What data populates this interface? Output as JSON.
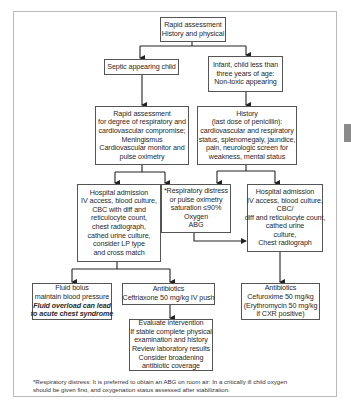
{
  "diagram": {
    "nodes": {
      "rapid_assessment": {
        "lines": [
          "Rapid assessment",
          "History and physical"
        ]
      },
      "septic": {
        "lines": [
          "Septic appearing child"
        ]
      },
      "infant": {
        "lines": [
          "Infant, child less than",
          "three years of age:",
          "Non-toxic appearing"
        ]
      },
      "rapid_assessment_degree": {
        "lines": [
          "Rapid assessment",
          "for degree of respiratory and",
          "cardiovascular compromise;",
          "Meningismus",
          "Cardiovascular monitor and",
          "pulse oximetry"
        ]
      },
      "history": {
        "lines": [
          "History",
          "(last dose of penicillin):",
          "cardiovascular and respiratory",
          "status, splenomegaly, jaundice,",
          "pain, neurologic screen for",
          "weakness, mental status"
        ]
      },
      "hospital_left": {
        "lines": [
          "Hospital admission",
          "IV access, blood culture,",
          "CBC with diff and",
          "reticulocyte count,",
          "chest radiograph,",
          "cathed urine culture,",
          "consider LP type",
          "and cross match"
        ]
      },
      "resp_distress": {
        "lines": [
          "*Respiratory distress",
          "or pulse oximetry",
          "saturation ≤90%",
          "Oxygen",
          "ABG"
        ]
      },
      "hospital_right": {
        "lines": [
          "Hospital admission",
          "IV access, blood culture,",
          "CBC/",
          "diff and reticulocyte count,",
          "cathed urine",
          "culture,",
          "Chest radiograph"
        ]
      },
      "fluid_bolus": {
        "lines": [
          "Fluid bolus",
          "maintain blood pressure"
        ],
        "emphasis": [
          "Fluid overload can lead",
          "to acute chest syndrome"
        ]
      },
      "antibiotics_ceftriaxone": {
        "lines": [
          "Antibiotics",
          "Ceftriaxone 50 mg/kg IV push"
        ]
      },
      "evaluate": {
        "lines": [
          "Evaluate intervention",
          "If stable complete physical",
          "examination and history",
          "Review laboratory results",
          "Consider broadening",
          "antibiotic coverage"
        ]
      },
      "antibiotics_cefuroxime": {
        "lines": [
          "Antibiotics",
          "Cefuroxime 50 mg/kg",
          "(Erythromycin 50 mg/kg",
          "if CXR positive)"
        ]
      }
    },
    "edges": [
      [
        "rapid_assessment",
        "septic"
      ],
      [
        "rapid_assessment",
        "infant"
      ],
      [
        "septic",
        "rapid_assessment_degree"
      ],
      [
        "infant",
        "history"
      ],
      [
        "rapid_assessment_degree",
        "hospital_left"
      ],
      [
        "rapid_assessment_degree",
        "resp_distress"
      ],
      [
        "history",
        "resp_distress"
      ],
      [
        "history",
        "hospital_right"
      ],
      [
        "resp_distress",
        "hospital_right"
      ],
      [
        "hospital_left",
        "fluid_bolus"
      ],
      [
        "hospital_left",
        "antibiotics_ceftriaxone"
      ],
      [
        "antibiotics_ceftriaxone",
        "evaluate"
      ],
      [
        "hospital_right",
        "antibiotics_cefuroxime"
      ]
    ],
    "footnote": [
      "*Respiratory distress: It is preferred to obtain an ABG on room air: In a critically ill child oxygen",
      "should be given first, and oxygenation status assessed after stabilization."
    ]
  }
}
